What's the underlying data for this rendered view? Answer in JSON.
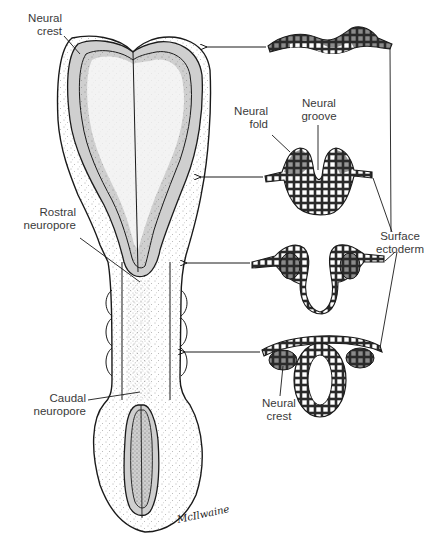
{
  "figure": {
    "labels": {
      "neural_crest_top": "Neural\ncrest",
      "neural_fold": "Neural\nfold",
      "neural_groove": "Neural\ngroove",
      "surface_ectoderm": "Surface\nectoderm",
      "rostral_neuropore": "Rostral\nneuropore",
      "caudal_neuropore": "Caudal\nneuropore",
      "neural_crest_bottom": "Neural\ncrest"
    },
    "cross_sections": [
      {
        "stage": "neural plate",
        "arrow_y": 47
      },
      {
        "stage": "neural groove",
        "arrow_y": 177
      },
      {
        "stage": "neural folds elevating",
        "arrow_y": 262
      },
      {
        "stage": "neural tube closed",
        "arrow_y": 351
      }
    ],
    "signature": "McIlwaine",
    "colors": {
      "ink": "#1a1a1a",
      "neural_plate_gray": "#cfcfcf",
      "cell_dark": "#6e6e6e",
      "background": "#ffffff"
    }
  }
}
